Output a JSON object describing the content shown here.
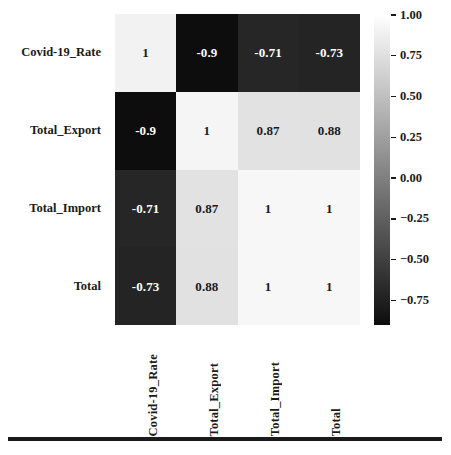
{
  "chart_data": {
    "type": "heatmap",
    "title": "",
    "xlabel": "",
    "ylabel": "",
    "colormap": "grayscale",
    "grid": false,
    "legend_position": "right-colorbar",
    "categories": [
      "Covid-19_Rate",
      "Total_Export",
      "Total_Import",
      "Total"
    ],
    "row_labels": [
      "Covid-19_Rate",
      "Total_Export",
      "Total_Import",
      "Total"
    ],
    "col_labels": [
      "Covid-19_Rate",
      "Total_Export",
      "Total_Import",
      "Total"
    ],
    "matrix": [
      [
        1,
        -0.9,
        -0.71,
        -0.73
      ],
      [
        -0.9,
        1,
        0.87,
        0.88
      ],
      [
        -0.71,
        0.87,
        1,
        1
      ],
      [
        -0.73,
        0.88,
        1,
        1
      ]
    ],
    "cell_text": [
      [
        "1",
        "-0.9",
        "-0.71",
        "-0.73"
      ],
      [
        "-0.9",
        "1",
        "0.87",
        "0.88"
      ],
      [
        "-0.71",
        "0.87",
        "1",
        "1"
      ],
      [
        "-0.73",
        "0.88",
        "1",
        "1"
      ]
    ],
    "cell_colors": [
      [
        "#f2f2f2",
        "#0d0d0d",
        "#262626",
        "#242424"
      ],
      [
        "#0d0d0d",
        "#f5f5f5",
        "#e2e2e2",
        "#e1e1e1"
      ],
      [
        "#262626",
        "#e2e2e2",
        "#f7f7f7",
        "#f7f7f7"
      ],
      [
        "#242424",
        "#e1e1e1",
        "#f7f7f7",
        "#f7f7f7"
      ]
    ],
    "cell_text_colors": [
      [
        "#1a1a1a",
        "#ffffff",
        "#ffffff",
        "#ffffff"
      ],
      [
        "#ffffff",
        "#1a1a1a",
        "#1a1a1a",
        "#1a1a1a"
      ],
      [
        "#ffffff",
        "#1a1a1a",
        "#1a1a1a",
        "#1a1a1a"
      ],
      [
        "#ffffff",
        "#1a1a1a",
        "#1a1a1a",
        "#1a1a1a"
      ]
    ],
    "colorbar": {
      "ticks": [
        "1.00",
        "0.75",
        "0.50",
        "0.25",
        "0.00",
        "−0.25",
        "−0.50",
        "−0.75"
      ],
      "tick_values": [
        1.0,
        0.75,
        0.5,
        0.25,
        0.0,
        -0.25,
        -0.5,
        -0.75
      ],
      "vmin": -0.9,
      "vmax": 1.0,
      "top_color": "#ffffff",
      "bottom_color": "#0d0d0d"
    },
    "zlim": [
      -0.9,
      1.0
    ]
  },
  "colors": {
    "background": "#ffffff",
    "text": "#1a1a1a",
    "cell_text_light": "#ffffff",
    "rule": "#1a1a1a"
  }
}
